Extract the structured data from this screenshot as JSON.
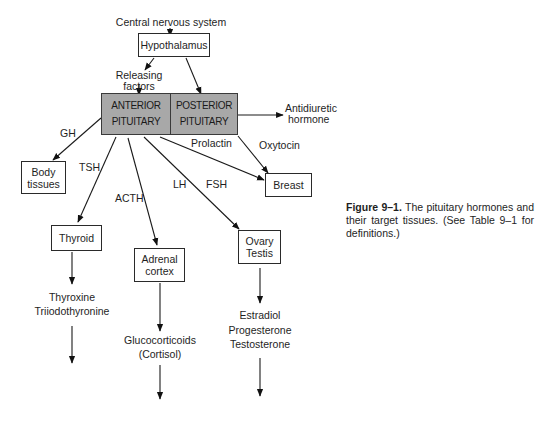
{
  "diagram": {
    "source": "Central nervous system",
    "hypothalamus": "Hypothalamus",
    "releasing_factors": [
      "Releasing",
      "factors"
    ],
    "anterior_pituitary": [
      "ANTERIOR",
      "PITUITARY"
    ],
    "posterior_pituitary": [
      "POSTERIOR",
      "PITUITARY"
    ],
    "antidiuretic_hormone": [
      "Antidiuretic",
      "hormone"
    ],
    "hormones": {
      "gh": "GH",
      "tsh": "TSH",
      "acth": "ACTH",
      "lh": "LH",
      "fsh": "FSH",
      "prolactin": "Prolactin",
      "oxytocin": "Oxytocin"
    },
    "targets": {
      "body_tissues": [
        "Body",
        "tissues"
      ],
      "thyroid": "Thyroid",
      "adrenal_cortex": [
        "Adrenal",
        "cortex"
      ],
      "ovary_testis": [
        "Ovary",
        "Testis"
      ],
      "breast": "Breast"
    },
    "products": {
      "thyroid": [
        "Thyroxine",
        "Triiodothyronine"
      ],
      "adrenal": [
        "Glucocorticoids",
        "(Cortisol)"
      ],
      "gonads": [
        "Estradiol",
        "Progesterone",
        "Testosterone"
      ]
    }
  },
  "caption": {
    "label": "Figure 9–1.",
    "text": " The pituitary hormones and their target tissues. (See Table 9–1 for definitions.)"
  }
}
